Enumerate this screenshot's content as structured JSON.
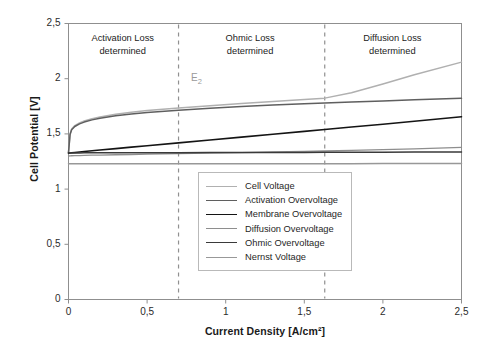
{
  "chart_data": {
    "type": "line",
    "title": "",
    "xlabel": "Current Density [A/cm²]",
    "ylabel": "Cell Potential [V]",
    "xlim": [
      0,
      2.5
    ],
    "ylim": [
      0,
      2.5
    ],
    "grid": false,
    "legend_position": "inside-center-bottom",
    "xticks": [
      "0",
      "0,5",
      "1",
      "1,5",
      "2",
      "2,5"
    ],
    "xtick_values": [
      0,
      0.5,
      1,
      1.5,
      2,
      2.5
    ],
    "yticks": [
      "0",
      "0,5",
      "1",
      "1,5",
      "2",
      "2,5"
    ],
    "ytick_values": [
      0,
      0.5,
      1,
      1.5,
      2,
      2.5
    ],
    "x": [
      0,
      0.01,
      0.02,
      0.04,
      0.07,
      0.1,
      0.15,
      0.2,
      0.3,
      0.4,
      0.5,
      0.7,
      0.9,
      1.1,
      1.3,
      1.5,
      1.63,
      1.8,
      2.0,
      2.2,
      2.5
    ],
    "series": [
      {
        "name": "Cell Voltage",
        "color": "#b0b0b0",
        "width": 1.5,
        "values": [
          1.33,
          1.5,
          1.545,
          1.575,
          1.6,
          1.617,
          1.638,
          1.654,
          1.678,
          1.696,
          1.711,
          1.735,
          1.756,
          1.775,
          1.794,
          1.812,
          1.824,
          1.872,
          1.952,
          2.036,
          2.15
        ]
      },
      {
        "name": "Activation Overvoltage",
        "color": "#5f5f5f",
        "width": 1.5,
        "values": [
          1.33,
          1.495,
          1.538,
          1.567,
          1.591,
          1.607,
          1.627,
          1.642,
          1.664,
          1.681,
          1.694,
          1.715,
          1.733,
          1.748,
          1.761,
          1.773,
          1.78,
          1.789,
          1.799,
          1.809,
          1.822
        ]
      },
      {
        "name": "Membrane Overvoltage",
        "color": "#141414",
        "width": 1.6,
        "values": [
          1.325,
          1.327,
          1.329,
          1.332,
          1.336,
          1.34,
          1.347,
          1.354,
          1.367,
          1.38,
          1.393,
          1.419,
          1.445,
          1.471,
          1.497,
          1.523,
          1.54,
          1.562,
          1.588,
          1.614,
          1.655
        ]
      },
      {
        "name": "Diffusion Overvoltage",
        "color": "#8e8e8e",
        "width": 1.3,
        "values": [
          1.3,
          1.301,
          1.302,
          1.303,
          1.304,
          1.305,
          1.307,
          1.308,
          1.311,
          1.313,
          1.316,
          1.321,
          1.326,
          1.331,
          1.336,
          1.341,
          1.345,
          1.35,
          1.357,
          1.365,
          1.378
        ]
      },
      {
        "name": "Ohmic Overvoltage",
        "color": "#3a3a3a",
        "width": 1.5,
        "values": [
          1.328,
          1.328,
          1.328,
          1.328,
          1.328,
          1.329,
          1.329,
          1.329,
          1.329,
          1.33,
          1.33,
          1.33,
          1.331,
          1.331,
          1.332,
          1.332,
          1.333,
          1.333,
          1.334,
          1.335,
          1.336
        ]
      },
      {
        "name": "Nernst Voltage",
        "color": "#989898",
        "width": 1.5,
        "values": [
          1.229,
          1.229,
          1.229,
          1.229,
          1.229,
          1.229,
          1.229,
          1.229,
          1.229,
          1.229,
          1.229,
          1.229,
          1.229,
          1.229,
          1.23,
          1.23,
          1.23,
          1.23,
          1.231,
          1.231,
          1.232
        ]
      }
    ],
    "annotations": [
      {
        "text": "E",
        "sub": "2",
        "x": 0.78,
        "y": 2.0,
        "color": "#9a9a9a"
      }
    ],
    "dividers": [
      {
        "x": 0.7,
        "style": "dashed",
        "color": "#909090"
      },
      {
        "x": 1.63,
        "style": "dashed",
        "color": "#909090"
      }
    ],
    "regions": [
      {
        "line1": "Activation Loss",
        "line2": "determined",
        "x_center": 0.345
      },
      {
        "line1": "Ohmic Loss",
        "line2": "determined",
        "x_center": 1.155
      },
      {
        "line1": "Diffusion Loss",
        "line2": "determined",
        "x_center": 2.06
      }
    ]
  },
  "axes": {
    "xlabel": "Current Density [A/cm²]",
    "ylabel": "Cell Potential [V]"
  }
}
